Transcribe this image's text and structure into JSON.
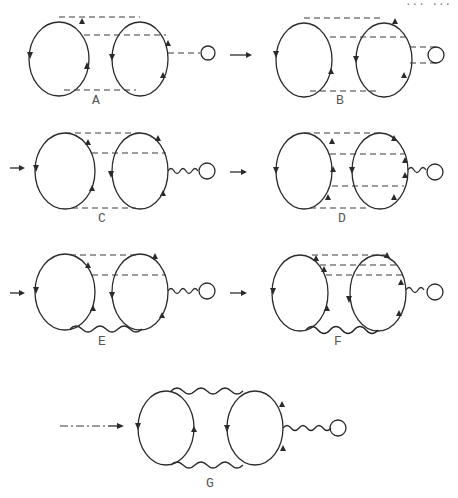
{
  "header": {
    "corner_text": "... ..."
  },
  "panels": [
    {
      "id": "A",
      "label": "A",
      "rungs_top": 2,
      "rungs_bottom": 1,
      "right_link": "dashed",
      "tadpole": "loop"
    },
    {
      "id": "B",
      "label": "B",
      "rungs_top": 2,
      "rungs_bottom": 1,
      "right_link": "double-dashed",
      "tadpole": "loop"
    },
    {
      "id": "C",
      "label": "C",
      "rungs_top": 2,
      "rungs_bottom": 1,
      "right_link": "wavy",
      "tadpole": "loop"
    },
    {
      "id": "D",
      "label": "D",
      "rungs_top": 2,
      "rungs_middle": 1,
      "rungs_bottom": 1,
      "right_link": "wavy",
      "tadpole": "loop"
    },
    {
      "id": "E",
      "label": "E",
      "rungs_top": 2,
      "bottom_link": "wavy",
      "right_link": "wavy",
      "tadpole": "loop"
    },
    {
      "id": "F",
      "label": "F",
      "rungs_top": 3,
      "bottom_link": "wavy",
      "right_link": "wavy",
      "tadpole": "loop"
    },
    {
      "id": "G",
      "label": "G",
      "top_link": "wavy",
      "bottom_link": "wavy",
      "right_link": "wavy",
      "tadpole": "loop"
    }
  ],
  "transitions": [
    {
      "from": "A",
      "to": "B",
      "style": "arrow"
    },
    {
      "from": "B",
      "to": "C",
      "style": "arrow"
    },
    {
      "from": "C",
      "to": "D",
      "style": "arrow"
    },
    {
      "from": "D",
      "to": "E",
      "style": "arrow"
    },
    {
      "from": "E",
      "to": "F",
      "style": "arrow"
    },
    {
      "from": "F",
      "to": "G",
      "style": "dash-dot-arrow"
    }
  ]
}
